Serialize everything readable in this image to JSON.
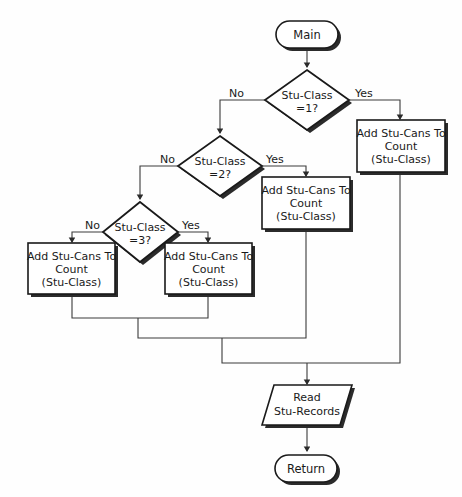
{
  "diagram": {
    "type": "flowchart",
    "nodes": [
      {
        "id": "start",
        "shape": "terminator",
        "label": "Main"
      },
      {
        "id": "dec1",
        "shape": "decision",
        "label_line1": "Stu-Class",
        "label_line2": "=1?"
      },
      {
        "id": "dec2",
        "shape": "decision",
        "label_line1": "Stu-Class",
        "label_line2": "=2?"
      },
      {
        "id": "dec3",
        "shape": "decision",
        "label_line1": "Stu-Class",
        "label_line2": "=3?"
      },
      {
        "id": "proc1",
        "shape": "process",
        "label_line1": "Add Stu-Cans To",
        "label_line2": "Count",
        "label_line3": "(Stu-Class)"
      },
      {
        "id": "proc2",
        "shape": "process",
        "label_line1": "Add Stu-Cans To",
        "label_line2": "Count",
        "label_line3": "(Stu-Class)"
      },
      {
        "id": "proc3",
        "shape": "process",
        "label_line1": "Add Stu-Cans To",
        "label_line2": "Count",
        "label_line3": "(Stu-Class)"
      },
      {
        "id": "proc4",
        "shape": "process",
        "label_line1": "Add Stu-Cans To",
        "label_line2": "Count",
        "label_line3": "(Stu-Class)"
      },
      {
        "id": "read",
        "shape": "input_output",
        "label_line1": "Read",
        "label_line2": "Stu-Records"
      },
      {
        "id": "end",
        "shape": "terminator",
        "label": "Return"
      }
    ],
    "edge_labels": {
      "dec1_no": "No",
      "dec1_yes": "Yes",
      "dec2_no": "No",
      "dec2_yes": "Yes",
      "dec3_no": "No",
      "dec3_yes": "Yes"
    },
    "colors": {
      "stroke": "#1a1a1a",
      "fill": "#ffffff",
      "connector": "#3a3a3a",
      "shadow": "#2b2b2b",
      "background": "#fefefe"
    }
  }
}
